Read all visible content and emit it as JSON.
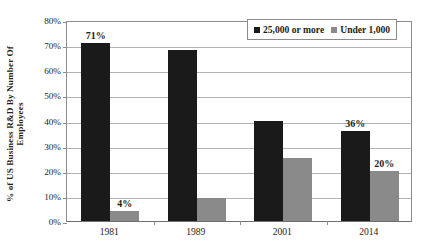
{
  "chart_data": {
    "type": "bar",
    "title": "",
    "xlabel": "",
    "ylabel": "% of US Business R&D By Number Of Employees",
    "ylabel_line1": "% of US Business R&D By Number Of",
    "ylabel_line2": "Employees",
    "categories": [
      "1981",
      "1989",
      "2001",
      "2014"
    ],
    "series": [
      {
        "name": "25,000 or more",
        "color": "#1a1a1a",
        "values": [
          71,
          68,
          40,
          36
        ],
        "labels": [
          "71%",
          "",
          "",
          "36%"
        ]
      },
      {
        "name": "Under 1,000",
        "color": "#8a8a8a",
        "values": [
          4,
          9,
          25,
          20
        ],
        "labels": [
          "4%",
          "",
          "",
          "20%"
        ]
      }
    ],
    "ylim": [
      0,
      80
    ],
    "ytick_values": [
      0,
      10,
      20,
      30,
      40,
      50,
      60,
      70,
      80
    ],
    "ytick_labels": [
      "0%",
      "10%",
      "20%",
      "30%",
      "40%",
      "50%",
      "60%",
      "70%",
      "80%"
    ],
    "grid": true,
    "legend_position": "top-right",
    "value_suffix": "%"
  },
  "legend": {
    "items": [
      {
        "label": "25,000 or more",
        "color": "#1a1a1a"
      },
      {
        "label": "Under 1,000",
        "color": "#8a8a8a"
      }
    ]
  }
}
